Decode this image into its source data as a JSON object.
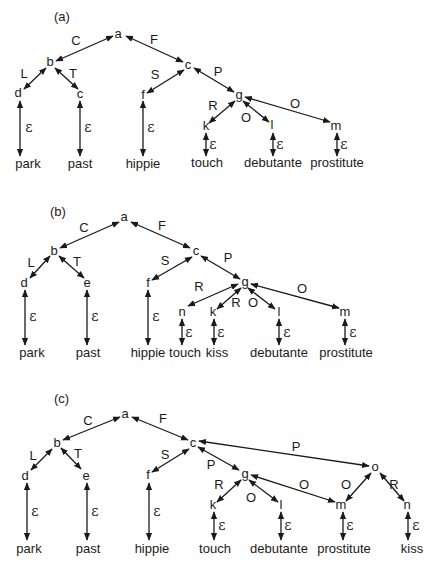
{
  "diagrams": [
    {
      "id": "a",
      "label": "(a)",
      "label_pos": [
        54,
        21
      ],
      "nodes": [
        {
          "id": "a",
          "text": "a",
          "x": 118,
          "y": 34
        },
        {
          "id": "b",
          "text": "b",
          "x": 50,
          "y": 62
        },
        {
          "id": "d",
          "text": "d",
          "x": 18,
          "y": 93
        },
        {
          "id": "c1",
          "text": "c",
          "x": 80,
          "y": 94
        },
        {
          "id": "c",
          "text": "c",
          "x": 188,
          "y": 65
        },
        {
          "id": "f",
          "text": "f",
          "x": 143,
          "y": 95
        },
        {
          "id": "g",
          "text": "g",
          "x": 239,
          "y": 95
        },
        {
          "id": "k",
          "text": "k",
          "x": 206,
          "y": 126
        },
        {
          "id": "l",
          "text": "l",
          "x": 272,
          "y": 125
        },
        {
          "id": "m",
          "text": "m",
          "x": 336,
          "y": 126
        }
      ],
      "leaves": [
        {
          "text": "park",
          "x": 28,
          "y": 168
        },
        {
          "text": "past",
          "x": 80,
          "y": 168
        },
        {
          "text": "hippie",
          "x": 143,
          "y": 168
        },
        {
          "text": "touch",
          "x": 207,
          "y": 167
        },
        {
          "text": "debutante",
          "x": 273,
          "y": 167
        },
        {
          "text": "prostitute",
          "x": 337,
          "y": 167
        }
      ],
      "edges": [
        {
          "x1": 113,
          "y1": 36,
          "x2": 56,
          "y2": 61,
          "label": "C",
          "lx": 76,
          "ly": 45
        },
        {
          "x1": 126,
          "y1": 36,
          "x2": 183,
          "y2": 62,
          "label": "F",
          "lx": 154,
          "ly": 44
        },
        {
          "x1": 46,
          "y1": 68,
          "x2": 24,
          "y2": 89,
          "label": "L",
          "lx": 24,
          "ly": 78
        },
        {
          "x1": 55,
          "y1": 68,
          "x2": 78,
          "y2": 89,
          "label": "T",
          "lx": 73,
          "ly": 78
        },
        {
          "x1": 184,
          "y1": 70,
          "x2": 147,
          "y2": 93,
          "label": "S",
          "lx": 155,
          "ly": 79
        },
        {
          "x1": 194,
          "y1": 68,
          "x2": 234,
          "y2": 92,
          "label": "P",
          "lx": 218,
          "ly": 76
        },
        {
          "x1": 235,
          "y1": 101,
          "x2": 209,
          "y2": 123,
          "label": "R",
          "lx": 213,
          "ly": 110
        },
        {
          "x1": 243,
          "y1": 101,
          "x2": 269,
          "y2": 122,
          "label": "O",
          "lx": 246,
          "ly": 122
        },
        {
          "x1": 245,
          "y1": 97,
          "x2": 330,
          "y2": 122,
          "label": "O",
          "lx": 295,
          "ly": 108
        },
        {
          "x1": 20,
          "y1": 101,
          "x2": 20,
          "y2": 156,
          "label": "ε",
          "lx": 29,
          "ly": 132
        },
        {
          "x1": 80,
          "y1": 101,
          "x2": 80,
          "y2": 156,
          "label": "ε",
          "lx": 88,
          "ly": 132
        },
        {
          "x1": 143,
          "y1": 101,
          "x2": 143,
          "y2": 156,
          "label": "ε",
          "lx": 151,
          "ly": 132
        },
        {
          "x1": 206,
          "y1": 133,
          "x2": 206,
          "y2": 156,
          "label": "ε",
          "lx": 213,
          "ly": 149
        },
        {
          "x1": 273,
          "y1": 133,
          "x2": 273,
          "y2": 156,
          "label": "ε",
          "lx": 280,
          "ly": 149
        },
        {
          "x1": 337,
          "y1": 133,
          "x2": 337,
          "y2": 156,
          "label": "ε",
          "lx": 344,
          "ly": 149
        }
      ]
    },
    {
      "id": "b",
      "label": "(b)",
      "label_pos": [
        50,
        216
      ],
      "nodes": [
        {
          "id": "a",
          "text": "a",
          "x": 124,
          "y": 217
        },
        {
          "id": "b",
          "text": "b",
          "x": 54,
          "y": 251
        },
        {
          "id": "d",
          "text": "d",
          "x": 24,
          "y": 283
        },
        {
          "id": "e",
          "text": "e",
          "x": 87,
          "y": 283
        },
        {
          "id": "c",
          "text": "c",
          "x": 196,
          "y": 251
        },
        {
          "id": "f",
          "text": "f",
          "x": 148,
          "y": 283
        },
        {
          "id": "g",
          "text": "g",
          "x": 245,
          "y": 282
        },
        {
          "id": "n",
          "text": "n",
          "x": 182,
          "y": 312
        },
        {
          "id": "k",
          "text": "k",
          "x": 213,
          "y": 312
        },
        {
          "id": "l",
          "text": "l",
          "x": 279,
          "y": 312
        },
        {
          "id": "m",
          "text": "m",
          "x": 345,
          "y": 312
        }
      ],
      "leaves": [
        {
          "text": "park",
          "x": 32,
          "y": 357
        },
        {
          "text": "past",
          "x": 88,
          "y": 357
        },
        {
          "text": "hippie",
          "x": 148,
          "y": 357
        },
        {
          "text": "touch",
          "x": 185,
          "y": 357
        },
        {
          "text": "kiss",
          "x": 217,
          "y": 357
        },
        {
          "text": "debutante",
          "x": 279,
          "y": 357
        },
        {
          "text": "prostitute",
          "x": 346,
          "y": 357
        }
      ],
      "edges": [
        {
          "x1": 119,
          "y1": 222,
          "x2": 60,
          "y2": 248,
          "label": "C",
          "lx": 84,
          "ly": 232
        },
        {
          "x1": 131,
          "y1": 222,
          "x2": 190,
          "y2": 248,
          "label": "F",
          "lx": 162,
          "ly": 230
        },
        {
          "x1": 50,
          "y1": 256,
          "x2": 30,
          "y2": 278,
          "label": "L",
          "lx": 31,
          "ly": 267
        },
        {
          "x1": 59,
          "y1": 256,
          "x2": 84,
          "y2": 278,
          "label": "T",
          "lx": 77,
          "ly": 266
        },
        {
          "x1": 192,
          "y1": 257,
          "x2": 152,
          "y2": 280,
          "label": "S",
          "lx": 165,
          "ly": 265
        },
        {
          "x1": 201,
          "y1": 256,
          "x2": 240,
          "y2": 279,
          "label": "P",
          "lx": 228,
          "ly": 262
        },
        {
          "x1": 238,
          "y1": 284,
          "x2": 188,
          "y2": 306,
          "label": "R",
          "lx": 199,
          "ly": 291
        },
        {
          "x1": 241,
          "y1": 288,
          "x2": 217,
          "y2": 309,
          "label": "R",
          "lx": 236,
          "ly": 307
        },
        {
          "x1": 248,
          "y1": 288,
          "x2": 275,
          "y2": 309,
          "label": "O",
          "lx": 253,
          "ly": 307
        },
        {
          "x1": 251,
          "y1": 284,
          "x2": 339,
          "y2": 308,
          "label": "O",
          "lx": 302,
          "ly": 293
        },
        {
          "x1": 25,
          "y1": 290,
          "x2": 25,
          "y2": 345,
          "label": "ε",
          "lx": 33,
          "ly": 321
        },
        {
          "x1": 87,
          "y1": 290,
          "x2": 87,
          "y2": 345,
          "label": "ε",
          "lx": 95,
          "ly": 321
        },
        {
          "x1": 148,
          "y1": 290,
          "x2": 148,
          "y2": 345,
          "label": "ε",
          "lx": 156,
          "ly": 321
        },
        {
          "x1": 182,
          "y1": 319,
          "x2": 182,
          "y2": 345,
          "label": "ε",
          "lx": 189,
          "ly": 337
        },
        {
          "x1": 214,
          "y1": 319,
          "x2": 214,
          "y2": 345,
          "label": "ε",
          "lx": 221,
          "ly": 337
        },
        {
          "x1": 279,
          "y1": 319,
          "x2": 279,
          "y2": 345,
          "label": "ε",
          "lx": 287,
          "ly": 337
        },
        {
          "x1": 345,
          "y1": 319,
          "x2": 345,
          "y2": 345,
          "label": "ε",
          "lx": 353,
          "ly": 337
        }
      ]
    },
    {
      "id": "c",
      "label": "(c)",
      "label_pos": [
        54,
        403
      ],
      "nodes": [
        {
          "id": "a",
          "text": "a",
          "x": 125,
          "y": 414
        },
        {
          "id": "b",
          "text": "b",
          "x": 57,
          "y": 443
        },
        {
          "id": "d",
          "text": "d",
          "x": 25,
          "y": 476
        },
        {
          "id": "e",
          "text": "e",
          "x": 86,
          "y": 476
        },
        {
          "id": "c",
          "text": "c",
          "x": 193,
          "y": 443
        },
        {
          "id": "f",
          "text": "f",
          "x": 148,
          "y": 475
        },
        {
          "id": "g",
          "text": "g",
          "x": 245,
          "y": 474
        },
        {
          "id": "k",
          "text": "k",
          "x": 213,
          "y": 505
        },
        {
          "id": "l",
          "text": "l",
          "x": 281,
          "y": 505
        },
        {
          "id": "m",
          "text": "m",
          "x": 341,
          "y": 505
        },
        {
          "id": "o",
          "text": "o",
          "x": 375,
          "y": 467
        },
        {
          "id": "n",
          "text": "n",
          "x": 407,
          "y": 505
        }
      ],
      "leaves": [
        {
          "text": "park",
          "x": 29,
          "y": 553
        },
        {
          "text": "past",
          "x": 88,
          "y": 553
        },
        {
          "text": "hippie",
          "x": 152,
          "y": 553
        },
        {
          "text": "touch",
          "x": 215,
          "y": 553
        },
        {
          "text": "debutante",
          "x": 279,
          "y": 553
        },
        {
          "text": "prostitute",
          "x": 344,
          "y": 553
        },
        {
          "text": "kiss",
          "x": 412,
          "y": 553
        }
      ],
      "edges": [
        {
          "x1": 120,
          "y1": 417,
          "x2": 63,
          "y2": 440,
          "label": "C",
          "lx": 88,
          "ly": 425
        },
        {
          "x1": 132,
          "y1": 417,
          "x2": 188,
          "y2": 440,
          "label": "F",
          "lx": 163,
          "ly": 423
        },
        {
          "x1": 52,
          "y1": 449,
          "x2": 31,
          "y2": 470,
          "label": "L",
          "lx": 33,
          "ly": 460
        },
        {
          "x1": 61,
          "y1": 448,
          "x2": 81,
          "y2": 469,
          "label": "T",
          "lx": 78,
          "ly": 458
        },
        {
          "x1": 189,
          "y1": 449,
          "x2": 152,
          "y2": 472,
          "label": "S",
          "lx": 165,
          "ly": 459
        },
        {
          "x1": 198,
          "y1": 447,
          "x2": 239,
          "y2": 470,
          "label": "P",
          "lx": 211,
          "ly": 469
        },
        {
          "x1": 199,
          "y1": 441,
          "x2": 369,
          "y2": 466,
          "label": "P",
          "lx": 296,
          "ly": 451
        },
        {
          "x1": 241,
          "y1": 480,
          "x2": 217,
          "y2": 502,
          "label": "R",
          "lx": 219,
          "ly": 489
        },
        {
          "x1": 249,
          "y1": 480,
          "x2": 278,
          "y2": 502,
          "label": "O",
          "lx": 251,
          "ly": 502
        },
        {
          "x1": 251,
          "y1": 475,
          "x2": 335,
          "y2": 502,
          "label": "O",
          "lx": 304,
          "ly": 489
        },
        {
          "x1": 371,
          "y1": 473,
          "x2": 346,
          "y2": 501,
          "label": "O",
          "lx": 346,
          "ly": 489
        },
        {
          "x1": 380,
          "y1": 473,
          "x2": 404,
          "y2": 501,
          "label": "R",
          "lx": 394,
          "ly": 489
        },
        {
          "x1": 27,
          "y1": 483,
          "x2": 27,
          "y2": 540,
          "label": "ε",
          "lx": 35,
          "ly": 516
        },
        {
          "x1": 87,
          "y1": 483,
          "x2": 87,
          "y2": 540,
          "label": "ε",
          "lx": 95,
          "ly": 516
        },
        {
          "x1": 149,
          "y1": 483,
          "x2": 149,
          "y2": 540,
          "label": "ε",
          "lx": 157,
          "ly": 516
        },
        {
          "x1": 214,
          "y1": 512,
          "x2": 214,
          "y2": 540,
          "label": "ε",
          "lx": 222,
          "ly": 530
        },
        {
          "x1": 281,
          "y1": 512,
          "x2": 281,
          "y2": 540,
          "label": "ε",
          "lx": 288,
          "ly": 530
        },
        {
          "x1": 343,
          "y1": 512,
          "x2": 343,
          "y2": 540,
          "label": "ε",
          "lx": 350,
          "ly": 530
        },
        {
          "x1": 408,
          "y1": 512,
          "x2": 408,
          "y2": 540,
          "label": "ε",
          "lx": 416,
          "ly": 530
        }
      ]
    }
  ],
  "colors": {
    "ink": "#1a1a1a",
    "background": "#ffffff"
  }
}
